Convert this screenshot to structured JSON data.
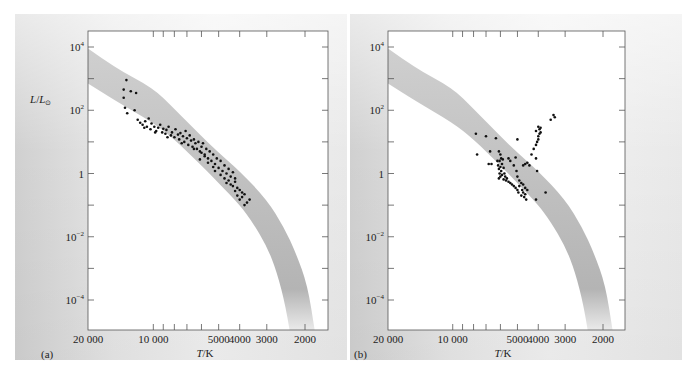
{
  "figure": {
    "panels": [
      "(a)",
      "(b)"
    ]
  },
  "chart_data": [
    {
      "type": "scatter",
      "panel_label": "(a)",
      "title": "",
      "xlabel": "T/K",
      "ylabel": "L/L⊙",
      "x_scale": "log-reversed",
      "y_scale": "log",
      "xlim": [
        20000,
        1700
      ],
      "ylim": [
        1e-05,
        30000
      ],
      "x_ticks": [
        {
          "value": 20000,
          "label": "20 000"
        },
        {
          "value": 10000,
          "label": "10 000"
        },
        {
          "value": 5000,
          "label": "5000"
        },
        {
          "value": 4000,
          "label": "4000"
        },
        {
          "value": 3000,
          "label": "3000"
        },
        {
          "value": 2000,
          "label": "2000"
        }
      ],
      "x_minor_ticks": [
        9000,
        8000,
        7000,
        6000
      ],
      "y_ticks": [
        {
          "value": 10000,
          "label": "10^4",
          "base": "10",
          "exp": "4"
        },
        {
          "value": 1000,
          "label": ""
        },
        {
          "value": 100,
          "label": "10^2",
          "base": "10",
          "exp": "2"
        },
        {
          "value": 10,
          "label": ""
        },
        {
          "value": 1,
          "label": "1",
          "base": "1",
          "exp": ""
        },
        {
          "value": 0.1,
          "label": ""
        },
        {
          "value": 0.01,
          "label": "10^-2",
          "base": "10",
          "exp": "−2"
        },
        {
          "value": 0.001,
          "label": ""
        },
        {
          "value": 0.0001,
          "label": "10^-4",
          "base": "10",
          "exp": "−4"
        }
      ],
      "band": {
        "name": "main sequence",
        "upper": [
          [
            20000,
            9000
          ],
          [
            15000,
            2200
          ],
          [
            10000,
            500
          ],
          [
            8000,
            110
          ],
          [
            6000,
            15
          ],
          [
            5000,
            4.5
          ],
          [
            4000,
            1.2
          ],
          [
            3000,
            0.15
          ],
          [
            2500,
            0.02
          ],
          [
            2200,
            0.003
          ],
          [
            1950,
            0.0003
          ],
          [
            1800,
            1e-05
          ]
        ],
        "lower": [
          [
            20000,
            700
          ],
          [
            15000,
            200
          ],
          [
            10000,
            40
          ],
          [
            8000,
            12
          ],
          [
            6000,
            1.8
          ],
          [
            5000,
            0.5
          ],
          [
            4000,
            0.1
          ],
          [
            3500,
            0.03
          ],
          [
            3000,
            0.005
          ],
          [
            2700,
            0.0008
          ],
          [
            2450,
            6e-05
          ],
          [
            2350,
            1e-05
          ]
        ]
      },
      "points": [
        [
          13300,
          900
        ],
        [
          13700,
          450
        ],
        [
          13700,
          250
        ],
        [
          12700,
          400
        ],
        [
          12000,
          350
        ],
        [
          13500,
          120
        ],
        [
          12200,
          100
        ],
        [
          13200,
          80
        ],
        [
          11800,
          50
        ],
        [
          11500,
          40
        ],
        [
          11200,
          35
        ],
        [
          10900,
          45
        ],
        [
          10700,
          30
        ],
        [
          10500,
          55
        ],
        [
          10300,
          25
        ],
        [
          10200,
          38
        ],
        [
          9900,
          30
        ],
        [
          9700,
          22
        ],
        [
          9500,
          28
        ],
        [
          9300,
          35
        ],
        [
          9100,
          20
        ],
        [
          9000,
          26
        ],
        [
          8800,
          18
        ],
        [
          8700,
          24
        ],
        [
          8500,
          30
        ],
        [
          8300,
          16
        ],
        [
          8200,
          20
        ],
        [
          8000,
          14
        ],
        [
          7900,
          25
        ],
        [
          7700,
          17
        ],
        [
          7600,
          12
        ],
        [
          7500,
          19
        ],
        [
          7300,
          15
        ],
        [
          7200,
          10
        ],
        [
          7100,
          22
        ],
        [
          7000,
          13
        ],
        [
          6900,
          8
        ],
        [
          6800,
          16
        ],
        [
          6700,
          11
        ],
        [
          6600,
          7
        ],
        [
          6500,
          12
        ],
        [
          6400,
          9
        ],
        [
          6300,
          6
        ],
        [
          6200,
          10
        ],
        [
          6100,
          5
        ],
        [
          6000,
          7
        ],
        [
          5900,
          9
        ],
        [
          5800,
          4
        ],
        [
          5700,
          6
        ],
        [
          5600,
          3
        ],
        [
          5500,
          5
        ],
        [
          5400,
          2.5
        ],
        [
          5300,
          4
        ],
        [
          5200,
          2
        ],
        [
          5100,
          3
        ],
        [
          5600,
          2.2
        ],
        [
          5800,
          3.5
        ],
        [
          6000,
          4.5
        ],
        [
          5000,
          1.5
        ],
        [
          4900,
          2.5
        ],
        [
          4800,
          1.2
        ],
        [
          4700,
          1.8
        ],
        [
          4600,
          1
        ],
        [
          4500,
          1.4
        ],
        [
          4400,
          0.8
        ],
        [
          4300,
          1.1
        ],
        [
          4200,
          0.7
        ],
        [
          4500,
          0.6
        ],
        [
          4600,
          0.5
        ],
        [
          4400,
          0.45
        ],
        [
          4300,
          0.4
        ],
        [
          4200,
          0.55
        ],
        [
          4100,
          0.35
        ],
        [
          4000,
          0.3
        ],
        [
          3900,
          0.25
        ],
        [
          4100,
          0.2
        ],
        [
          4000,
          0.15
        ],
        [
          3900,
          0.18
        ],
        [
          3800,
          0.22
        ],
        [
          3700,
          0.12
        ],
        [
          3600,
          0.15
        ],
        [
          3800,
          0.1
        ],
        [
          4200,
          0.28
        ],
        [
          5200,
          1.2
        ],
        [
          4900,
          0.9
        ],
        [
          4700,
          0.7
        ],
        [
          6500,
          6
        ],
        [
          7400,
          9
        ],
        [
          8600,
          14
        ],
        [
          9800,
          20
        ],
        [
          11000,
          28
        ],
        [
          6100,
          2.8
        ],
        [
          5300,
          1.6
        ]
      ]
    },
    {
      "type": "scatter",
      "panel_label": "(b)",
      "title": "",
      "xlabel": "T/K",
      "ylabel": "",
      "x_scale": "log-reversed",
      "y_scale": "log",
      "xlim": [
        20000,
        1700
      ],
      "ylim": [
        1e-05,
        30000
      ],
      "x_ticks": [
        {
          "value": 20000,
          "label": "20 000"
        },
        {
          "value": 10000,
          "label": "10 000"
        },
        {
          "value": 5000,
          "label": "5000"
        },
        {
          "value": 4000,
          "label": "4000"
        },
        {
          "value": 3000,
          "label": "3000"
        },
        {
          "value": 2000,
          "label": "2000"
        }
      ],
      "x_minor_ticks": [
        9000,
        8000,
        7000,
        6000
      ],
      "y_ticks": [
        {
          "value": 10000,
          "label": "10^4",
          "base": "10",
          "exp": "4"
        },
        {
          "value": 1000,
          "label": ""
        },
        {
          "value": 100,
          "label": "10^2",
          "base": "10",
          "exp": "2"
        },
        {
          "value": 10,
          "label": ""
        },
        {
          "value": 1,
          "label": "1",
          "base": "1",
          "exp": ""
        },
        {
          "value": 0.1,
          "label": ""
        },
        {
          "value": 0.01,
          "label": "10^-2",
          "base": "10",
          "exp": "−2"
        },
        {
          "value": 0.001,
          "label": ""
        },
        {
          "value": 0.0001,
          "label": "10^-4",
          "base": "10",
          "exp": "−4"
        }
      ],
      "band": {
        "name": "main sequence",
        "upper": [
          [
            20000,
            9000
          ],
          [
            15000,
            2200
          ],
          [
            10000,
            500
          ],
          [
            8000,
            110
          ],
          [
            6000,
            15
          ],
          [
            5000,
            4.5
          ],
          [
            4000,
            1.2
          ],
          [
            3000,
            0.15
          ],
          [
            2500,
            0.02
          ],
          [
            2200,
            0.003
          ],
          [
            1950,
            0.0003
          ],
          [
            1800,
            1e-05
          ]
        ],
        "lower": [
          [
            20000,
            700
          ],
          [
            15000,
            200
          ],
          [
            10000,
            40
          ],
          [
            8000,
            12
          ],
          [
            6000,
            1.8
          ],
          [
            5000,
            0.5
          ],
          [
            4000,
            0.1
          ],
          [
            3500,
            0.03
          ],
          [
            3000,
            0.005
          ],
          [
            2700,
            0.0008
          ],
          [
            2450,
            6e-05
          ],
          [
            2350,
            1e-05
          ]
        ]
      },
      "points": [
        [
          7800,
          18
        ],
        [
          7700,
          4
        ],
        [
          7000,
          15
        ],
        [
          6700,
          5
        ],
        [
          6300,
          13
        ],
        [
          6600,
          2
        ],
        [
          6800,
          2
        ],
        [
          6100,
          5
        ],
        [
          6000,
          4
        ],
        [
          5950,
          3
        ],
        [
          6050,
          2.5
        ],
        [
          5900,
          2
        ],
        [
          6000,
          1.6
        ],
        [
          6100,
          1.4
        ],
        [
          5950,
          1.2
        ],
        [
          6050,
          1
        ],
        [
          5900,
          0.9
        ],
        [
          6000,
          0.8
        ],
        [
          6150,
          1.8
        ],
        [
          6200,
          2.5
        ],
        [
          5850,
          2.8
        ],
        [
          5800,
          1.5
        ],
        [
          5750,
          1
        ],
        [
          5700,
          0.8
        ],
        [
          5650,
          0.6
        ],
        [
          5600,
          0.7
        ],
        [
          5500,
          0.55
        ],
        [
          5400,
          0.5
        ],
        [
          5300,
          0.45
        ],
        [
          5200,
          0.4
        ],
        [
          5100,
          0.35
        ],
        [
          5000,
          0.3
        ],
        [
          4950,
          0.25
        ],
        [
          4900,
          0.4
        ],
        [
          4800,
          0.2
        ],
        [
          4750,
          0.3
        ],
        [
          4700,
          0.25
        ],
        [
          4650,
          0.18
        ],
        [
          4600,
          0.22
        ],
        [
          4550,
          0.15
        ],
        [
          4500,
          0.3
        ],
        [
          4600,
          0.35
        ],
        [
          4700,
          0.45
        ],
        [
          4800,
          0.5
        ],
        [
          4900,
          0.6
        ],
        [
          5000,
          0.8
        ],
        [
          5500,
          3
        ],
        [
          5400,
          2.5
        ],
        [
          5200,
          1.8
        ],
        [
          5050,
          1.2
        ],
        [
          6100,
          0.7
        ],
        [
          5800,
          0.65
        ],
        [
          4100,
          0.15
        ],
        [
          3700,
          0.25
        ],
        [
          5000,
          12
        ],
        [
          4700,
          1.8
        ],
        [
          4600,
          2
        ],
        [
          4500,
          2.2
        ],
        [
          4300,
          4
        ],
        [
          4200,
          6
        ],
        [
          4100,
          8
        ],
        [
          4050,
          10
        ],
        [
          4000,
          12
        ],
        [
          4000,
          15
        ],
        [
          3950,
          18
        ],
        [
          3900,
          20
        ],
        [
          3950,
          25
        ],
        [
          4000,
          30
        ],
        [
          3900,
          28
        ],
        [
          4100,
          22
        ],
        [
          3500,
          50
        ],
        [
          3400,
          70
        ],
        [
          3350,
          60
        ],
        [
          4100,
          3
        ],
        [
          4050,
          1.2
        ],
        [
          4400,
          1.8
        ],
        [
          5100,
          3.2
        ]
      ]
    }
  ]
}
